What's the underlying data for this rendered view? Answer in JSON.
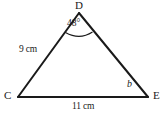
{
  "figure": {
    "type": "triangle-diagram",
    "shape_name": "triangle CDE",
    "background_color": "#ffffff",
    "stroke_color": "#1a1a1a",
    "stroke_width": 2,
    "vertices": [
      {
        "name": "D",
        "label": "D",
        "x": 79,
        "y": 13
      },
      {
        "name": "C",
        "label": "C",
        "x": 18,
        "y": 97
      },
      {
        "name": "E",
        "label": "E",
        "x": 148,
        "y": 97
      }
    ],
    "sides": [
      {
        "name": "CD",
        "label": "9 cm",
        "value": 9,
        "unit": "cm"
      },
      {
        "name": "CE",
        "label": "11 cm",
        "value": 11,
        "unit": "cm"
      },
      {
        "name": "DE",
        "label": "",
        "value": null,
        "unit": ""
      }
    ],
    "angles": [
      {
        "at": "D",
        "label": "48°",
        "value": 48,
        "unit": "degrees",
        "has_arc": true
      },
      {
        "at": "E",
        "label": "b",
        "value": null,
        "unit": "",
        "has_arc": false
      },
      {
        "at": "C",
        "label": "",
        "value": null,
        "unit": "",
        "has_arc": false
      }
    ]
  },
  "labels": {
    "vertex_d": "D",
    "vertex_c": "C",
    "vertex_e": "E",
    "side_cd": "9 cm",
    "side_ce": "11 cm",
    "angle_d": "48°",
    "angle_e": "b"
  }
}
